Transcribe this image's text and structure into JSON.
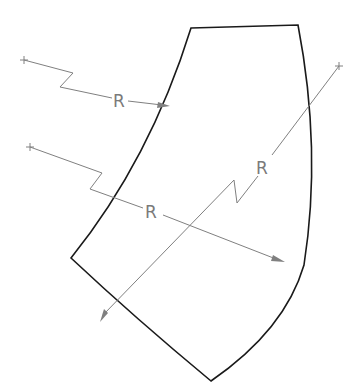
{
  "diagram": {
    "type": "technical-drawing",
    "colors": {
      "outline": "#1a1a1a",
      "dimension": "#808080",
      "background": "#ffffff"
    },
    "dimensions": [
      {
        "id": "inner-radius-upper",
        "label": "R"
      },
      {
        "id": "inner-radius-lower",
        "label": "R"
      },
      {
        "id": "outer-radius",
        "label": "R"
      }
    ]
  }
}
